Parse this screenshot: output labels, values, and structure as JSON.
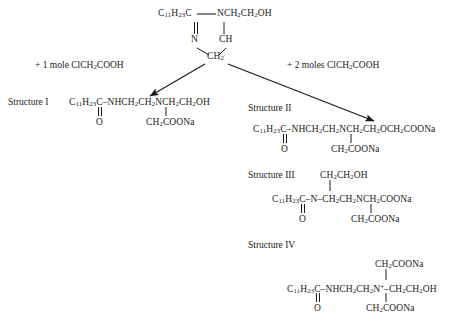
{
  "diagram": {
    "background": "#ffffff",
    "ink": "#1a1a1a"
  },
  "reactant": {
    "name": "imidazoline",
    "top_left": "C₁₁H₂₃C",
    "top_right": "NCH₂CH₂OH",
    "ring_n": "N",
    "ring_ch": "CH",
    "ring_ch2": "CH₂",
    "top_left_formula_html": "C<sub>11</sub>H<sub>23</sub>C",
    "top_right_formula_html": "NCH<sub>2</sub>CH<sub>2</sub>OH",
    "ring_ch2_html": "CH<sub>2</sub>"
  },
  "conditions": {
    "left": "+ 1 mole ClCH₂COOH",
    "left_html": "+ 1 mole ClCH<sub>2</sub>COOH",
    "right": "+ 2 moles ClCH₂COOH",
    "right_html": "+ 2 moles ClCH<sub>2</sub>COOH"
  },
  "structures": [
    {
      "label": "Structure I",
      "main": "C₁₁H₂₃C–NHCH₂CH₂NCH₂CH₂OH",
      "main_html": "C<sub>11</sub>H<sub>23</sub>C&#8211;NHCH<sub>2</sub>CH<sub>2</sub>NCH<sub>2</sub>CH<sub>2</sub>OH",
      "carbonyl": "O",
      "branch": "CH₂COONa",
      "branch_html": "CH<sub>2</sub>COONa"
    },
    {
      "label": "Structure II",
      "main": "C₁₁H₂₃C–NHCH₂CH₂NCH₂CH₂OCH₂COONa",
      "main_html": "C<sub>11</sub>H<sub>23</sub>C&#8211;NHCH<sub>2</sub>CH<sub>2</sub>NCH<sub>2</sub>CH<sub>2</sub>OCH<sub>2</sub>COONa",
      "carbonyl": "O",
      "branch": "CH₂COONa",
      "branch_html": "CH<sub>2</sub>COONa"
    },
    {
      "label": "Structure III",
      "top_branch": "CH₂CH₂OH",
      "top_branch_html": "CH<sub>2</sub>CH<sub>2</sub>OH",
      "main": "C₁₁H₂₃C–N–CH₂CH₂NCH₂COONa",
      "main_html": "C<sub>11</sub>H<sub>23</sub>C&#8211;N&#8211;CH<sub>2</sub>CH<sub>2</sub>NCH<sub>2</sub>COONa",
      "carbonyl": "O",
      "branch": "CH₂COONa",
      "branch_html": "CH<sub>2</sub>COONa"
    },
    {
      "label": "Structure IV",
      "top_branch": "CH₂COONa",
      "top_branch_html": "CH<sub>2</sub>COONa",
      "main": "C₁₁H₂₃C–NHCH₂CH₂N⁺–CH₂CH₂OH",
      "main_html": "C<sub>11</sub>H<sub>23</sub>C&#8211;NHCH<sub>2</sub>CH<sub>2</sub>N<sup>+</sup>&#8211;CH<sub>2</sub>CH<sub>2</sub>OH",
      "carbonyl": "O",
      "branch": "CH₂COONa",
      "branch_html": "CH<sub>2</sub>COONa"
    }
  ]
}
